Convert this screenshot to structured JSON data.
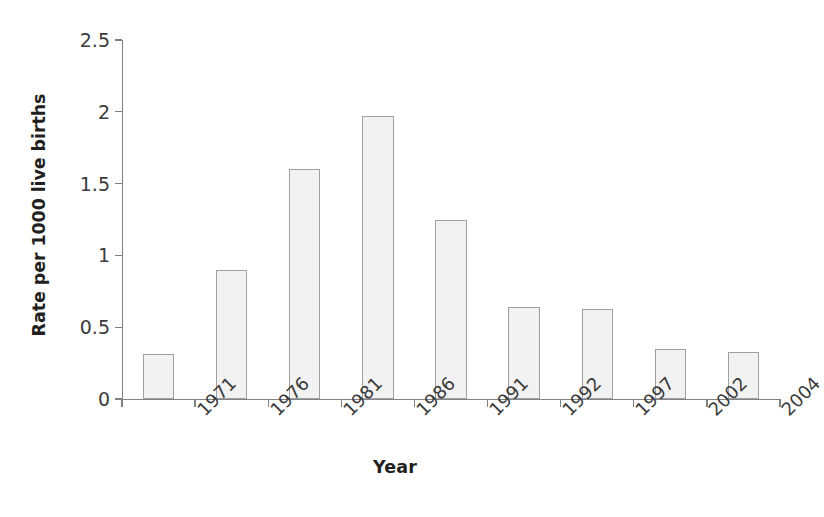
{
  "chart_data": {
    "type": "bar",
    "title": "",
    "xlabel": "Year",
    "ylabel": "Rate per 1000 live births",
    "categories": [
      "1971",
      "1976",
      "1981",
      "1986",
      "1991",
      "1992",
      "1997",
      "2002",
      "2004"
    ],
    "values": [
      0.31,
      0.9,
      1.6,
      1.97,
      1.25,
      0.64,
      0.63,
      0.35,
      0.33
    ],
    "ylim": [
      0,
      2.5
    ],
    "ytick_values": [
      0,
      0.5,
      1,
      1.5,
      2,
      2.5
    ],
    "ytick_labels": [
      "0",
      "0.5",
      "1",
      "1.5",
      "2",
      "2.5"
    ],
    "grid": false,
    "legend": "none",
    "bar_fill_color": "#f2f2f2",
    "bar_border_color": "#a0a0a0",
    "axis_color": "#808285",
    "background_color": "#ffffff",
    "xtick_label_rotation": -45
  }
}
